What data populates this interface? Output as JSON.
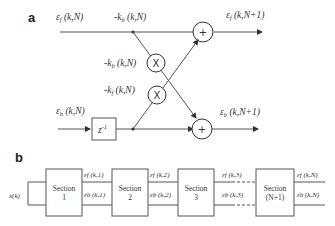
{
  "panel_a": {
    "label": "a",
    "input_forward": "ε_f (k,N)",
    "input_backward": "ε_b (k,N)",
    "coef_top": "-k_b (k,N)",
    "coef_mult1": "-k_b (k,N)",
    "coef_mult2": "-k_f (k,N)",
    "output_forward": "ε_f (k,N+1)",
    "output_backward": "ε_b (k,N+1)",
    "delay": "z⁻¹",
    "adder_symbol": "+",
    "multiplier_symbol": "X"
  },
  "panel_b": {
    "label": "b",
    "input": "x(k)",
    "sections": [
      {
        "name": "Section",
        "index": "1"
      },
      {
        "name": "Section",
        "index": "2"
      },
      {
        "name": "Section",
        "index": "3"
      },
      {
        "name": "Section",
        "index": "(N+1)"
      }
    ],
    "signals": [
      {
        "forward": "εf (k,1)",
        "backward": "εb (k,1)"
      },
      {
        "forward": "εf (k,2)",
        "backward": "εb (k,2)"
      },
      {
        "forward": "εf (k,3)",
        "backward": "εb (k,3)"
      },
      {
        "forward": "εf (k,N)",
        "backward": "εb (k,N)"
      }
    ]
  }
}
